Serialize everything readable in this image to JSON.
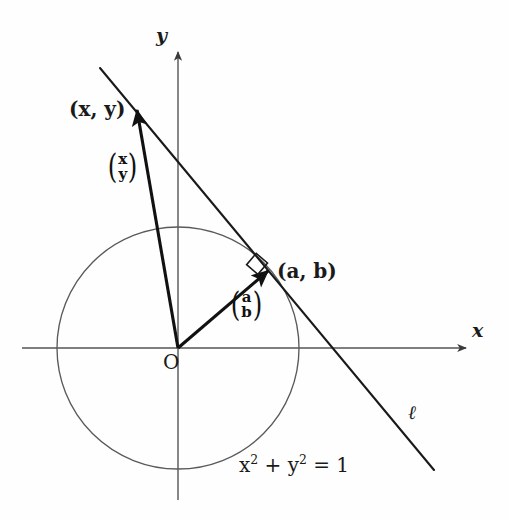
{
  "figure": {
    "kind": "geometry-diagram",
    "background_color": "#fefefe",
    "ink_color": "#1a1a1a",
    "thin_line_color": "#555555"
  },
  "axes": {
    "x_label": "x",
    "y_label": "y",
    "origin_label": "O"
  },
  "points": {
    "outer_point_label": "(x, y)",
    "tangent_point_label": "(a, b)"
  },
  "vectors": {
    "outer_vector_top": "x",
    "outer_vector_bottom": "y",
    "radius_vector_top": "a",
    "radius_vector_bottom": "b"
  },
  "line": {
    "label": "ℓ"
  },
  "circle": {
    "equation_lhs_1": "x",
    "equation_exp_1": "2",
    "equation_plus": "+",
    "equation_lhs_2": "y",
    "equation_exp_2": "2",
    "equation_eq": "= 1",
    "equation_full": "x² + y² = 1"
  },
  "geometry": {
    "origin_x": 178,
    "origin_y": 348,
    "circle_radius": 121,
    "tangent_point_x": 268,
    "tangent_point_y": 271,
    "outer_point_x": 137,
    "outer_point_y": 110
  }
}
